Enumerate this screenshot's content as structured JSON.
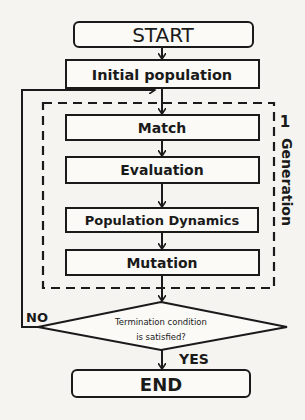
{
  "diagram": {
    "nodes": {
      "start": {
        "label": "START",
        "shape": "rounded-rect"
      },
      "initial_population": {
        "label": "Initial population",
        "shape": "rect"
      },
      "match": {
        "label": "Match",
        "shape": "rect"
      },
      "evaluation": {
        "label": "Evaluation",
        "shape": "rect"
      },
      "population_dynamics": {
        "label": "Population Dynamics",
        "shape": "rect"
      },
      "mutation": {
        "label": "Mutation",
        "shape": "rect"
      },
      "termination": {
        "label_line1": "Termination  condition",
        "label_line2": "is satisfied?",
        "shape": "diamond"
      },
      "end": {
        "label": "END",
        "shape": "rounded-rect"
      }
    },
    "group": {
      "label_number": "1",
      "label_text": "Generation",
      "style": "dashed"
    },
    "edges": {
      "no_label": "NO",
      "yes_label": "YES"
    },
    "colors": {
      "stroke": "#1a1a1a",
      "background": "#f5f4f0",
      "box_fill": "#fbfaf7"
    }
  }
}
